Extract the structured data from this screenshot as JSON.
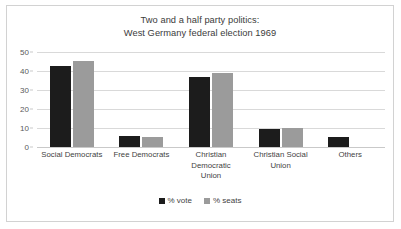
{
  "chart_data": {
    "type": "bar",
    "title": "Two and a half party politics: West Germany federal election 1969",
    "title_lines": [
      "Two and a half party politics:",
      "West Germany federal election 1969"
    ],
    "categories": [
      "Social Democrats",
      "Free Democrats",
      "Christian Democratic Union",
      "Christian Social Union",
      "Others"
    ],
    "category_lines": [
      [
        "Social Democrats"
      ],
      [
        "Free Democrats"
      ],
      [
        "Christian",
        "Democratic",
        "Union"
      ],
      [
        "Christian Social",
        "Union"
      ],
      [
        "Others"
      ]
    ],
    "series": [
      {
        "name": "% vote",
        "color": "#1c1c1c",
        "values": [
          42.7,
          5.8,
          36.6,
          9.5,
          5.5
        ]
      },
      {
        "name": "% seats",
        "color": "#9b9b9b",
        "values": [
          45.2,
          5.4,
          38.8,
          9.8,
          0
        ]
      }
    ],
    "xlabel": "",
    "ylabel": "",
    "ylim": [
      0,
      50
    ],
    "yticks": [
      0,
      10,
      20,
      30,
      40,
      50
    ],
    "ytick_labels": [
      "0",
      "10",
      "20",
      "30",
      "40",
      "50"
    ],
    "grid": true,
    "grid_axis": "y",
    "legend_position": "bottom",
    "legend_entries": [
      "% vote",
      "% seats"
    ]
  },
  "colors": {
    "vote": "#1c1c1c",
    "seats": "#9b9b9b",
    "gridline": "#d9d9d9",
    "border": "#d2d2d2",
    "text": "#3f3f3f",
    "background": "#ffffff"
  }
}
